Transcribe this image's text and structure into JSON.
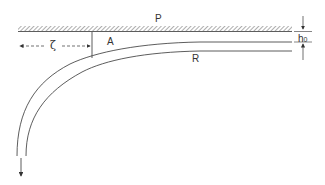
{
  "diagram": {
    "type": "peeling tape / film geometry schematic",
    "labels": {
      "plate": "P",
      "region": "A",
      "distance": "ζ",
      "film": "R",
      "thickness_base": "h",
      "thickness_sub": "0"
    },
    "colors": {
      "line": "#444444",
      "hatch": "#666666",
      "background": "#ffffff"
    }
  }
}
